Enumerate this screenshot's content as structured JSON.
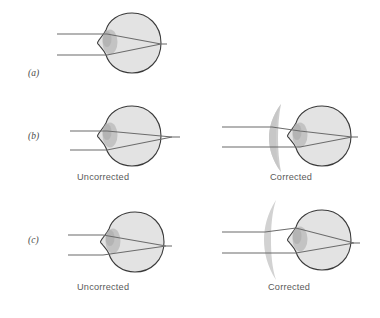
{
  "figure": {
    "width": 380,
    "height": 318,
    "background_color": "#ffffff"
  },
  "colors": {
    "eye_outline": "#3a3a3a",
    "eye_fill": "#e2e2e2",
    "lens_fill": "#c2c2c2",
    "cornea_fill": "#d0d0d0",
    "ray_line": "#6b6b6b",
    "corrective_lens": "#cfcfcf",
    "text": "#5a5a5a",
    "panel_letter": "#4a4a4a"
  },
  "panels": [
    {
      "id": "a",
      "letter": "(a)",
      "condition": "normal",
      "description": "Parallel rays focus exactly on the retina",
      "views": [
        {
          "key": "normal",
          "caption": null,
          "focus": "on-retina",
          "has_corrective_lens": false
        }
      ]
    },
    {
      "id": "b",
      "letter": "(b)",
      "condition": "hyperopia",
      "description": "Farsighted eye: rays converge behind the retina; converging lens corrects",
      "views": [
        {
          "key": "uncorrected",
          "caption": "Uncorrected",
          "focus": "behind-retina",
          "has_corrective_lens": false
        },
        {
          "key": "corrected",
          "caption": "Corrected",
          "focus": "on-retina",
          "has_corrective_lens": true,
          "lens_type": "converging-meniscus"
        }
      ]
    },
    {
      "id": "c",
      "letter": "(c)",
      "condition": "myopia",
      "description": "Nearsighted eye: rays converge in front of the retina; diverging lens corrects",
      "views": [
        {
          "key": "uncorrected",
          "caption": "Uncorrected",
          "focus": "in-front-of-retina",
          "has_corrective_lens": false
        },
        {
          "key": "corrected",
          "caption": "Corrected",
          "focus": "on-retina",
          "has_corrective_lens": true,
          "lens_type": "diverging-concave"
        }
      ]
    }
  ],
  "labels": {
    "panel_a": "(a)",
    "panel_b": "(b)",
    "panel_c": "(c)",
    "uncorrected_b": "Uncorrected",
    "corrected_b": "Corrected",
    "uncorrected_c": "Uncorrected",
    "corrected_c": "Corrected"
  }
}
